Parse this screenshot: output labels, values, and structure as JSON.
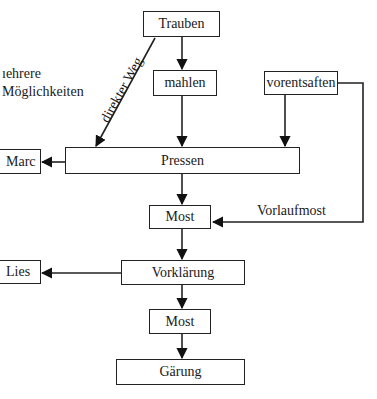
{
  "diagram": {
    "nodes": {
      "trauben": "Trauben",
      "mahlen": "mahlen",
      "vorentsaften": "vorentsaften",
      "pressen": "Pressen",
      "marc": "Marc",
      "most1": "Most",
      "vorklaerung": "Vorklärung",
      "lies": "Lies",
      "most2": "Most",
      "gaerung": "Gärung"
    },
    "edge_labels": {
      "direkter_weg": "direkter Weg",
      "vorlaufmost": "Vorlaufmost"
    },
    "side_note": {
      "line1": "ıehrere",
      "line2": "Möglichkeiten"
    },
    "edges": [
      {
        "from": "Trauben",
        "to": "mahlen"
      },
      {
        "from": "Trauben",
        "to": "Pressen",
        "label": "direkter Weg"
      },
      {
        "from": "mahlen",
        "to": "Pressen"
      },
      {
        "from": "vorentsaften",
        "to": "Pressen"
      },
      {
        "from": "vorentsaften",
        "to": "Most",
        "label": "Vorlaufmost"
      },
      {
        "from": "Pressen",
        "to": "Marc"
      },
      {
        "from": "Pressen",
        "to": "Most"
      },
      {
        "from": "Most",
        "to": "Vorklärung"
      },
      {
        "from": "Vorklärung",
        "to": "Lies"
      },
      {
        "from": "Vorklärung",
        "to": "Most"
      },
      {
        "from": "Most",
        "to": "Gärung"
      }
    ]
  }
}
